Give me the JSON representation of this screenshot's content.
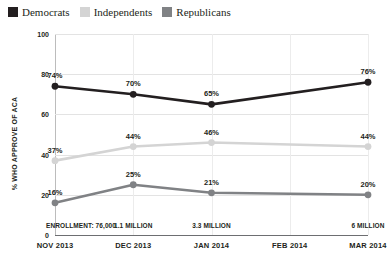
{
  "legend": {
    "items": [
      {
        "label": "Democrats",
        "color": "#231f20",
        "icon": "legend-swatch-democrats"
      },
      {
        "label": "Independents",
        "color": "#d4d4d4",
        "icon": "legend-swatch-independents"
      },
      {
        "label": "Republicans",
        "color": "#808285",
        "icon": "legend-swatch-republicans"
      }
    ]
  },
  "chart_data": {
    "type": "line",
    "title": "",
    "xlabel": "",
    "ylabel": "% WHO APPROVE OF ACA",
    "ylim": [
      0,
      100
    ],
    "yticks": [
      "0",
      "20",
      "40",
      "60",
      "80",
      "100"
    ],
    "ytick_values": [
      0,
      20,
      40,
      60,
      80,
      100
    ],
    "grid": true,
    "legend_position": "top-left",
    "categories": [
      "Nov 2013",
      "Dec 2013",
      "Jan 2014",
      "Feb 2014",
      "Mar 2014"
    ],
    "series": [
      {
        "name": "Democrats",
        "color": "#231f20",
        "values": [
          74,
          70,
          65,
          null,
          76
        ],
        "labels": [
          "74%",
          "70%",
          "65%",
          "",
          "76%"
        ]
      },
      {
        "name": "Independents",
        "color": "#d4d4d4",
        "values": [
          37,
          44,
          46,
          null,
          44
        ],
        "labels": [
          "37%",
          "44%",
          "46%",
          "",
          "44%"
        ]
      },
      {
        "name": "Republicans",
        "color": "#808285",
        "values": [
          16,
          25,
          21,
          null,
          20
        ],
        "labels": [
          "16%",
          "25%",
          "21%",
          "",
          "20%"
        ]
      }
    ],
    "annotations": [
      {
        "category": "Nov 2013",
        "text": "ENROLLMENT: 76,000"
      },
      {
        "category": "Dec 2013",
        "text": "1.1 MILLION"
      },
      {
        "category": "Jan 2014",
        "text": "3.3 MILLION"
      },
      {
        "category": "Mar 2014",
        "text": "6 MILLION"
      }
    ]
  }
}
